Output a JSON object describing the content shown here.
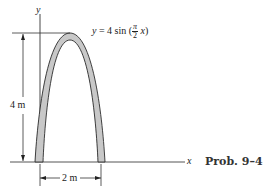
{
  "figure": {
    "axes": {
      "y_label": "y",
      "x_label": "x"
    },
    "equation": {
      "lhs": "y",
      "eq": "= 4 sin (",
      "frac_num": "π",
      "frac_den": "2",
      "var": "x",
      "close": ")"
    },
    "dimensions": {
      "height": "4 m",
      "width": "2 m"
    },
    "caption": "Prob. 9–4",
    "colors": {
      "arch_fill": "#c8c8c8",
      "line": "#2a2a2a"
    }
  }
}
